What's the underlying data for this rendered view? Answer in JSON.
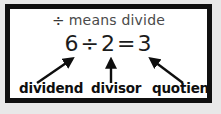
{
  "card": {
    "border_color": "#101010",
    "background_color": "#ffffff",
    "page_background": "#e8e8e8"
  },
  "title": {
    "symbol": "÷",
    "text": "means divide",
    "full": "÷ means divide"
  },
  "equation": {
    "dividend": "6",
    "operator": "÷",
    "divisor": "2",
    "equals": "=",
    "quotient": "3",
    "full": "6 ÷ 2 = 3"
  },
  "labels": {
    "dividend": "dividend",
    "divisor": "divisor",
    "quotient": "quotient"
  },
  "arrows": [
    {
      "name": "arrow-dividend",
      "direction": "up-right",
      "from_label": "dividend",
      "to_term": "6"
    },
    {
      "name": "arrow-divisor",
      "direction": "up",
      "from_label": "divisor",
      "to_term": "2"
    },
    {
      "name": "arrow-quotient",
      "direction": "up-left",
      "from_label": "quotient",
      "to_term": "3"
    }
  ]
}
